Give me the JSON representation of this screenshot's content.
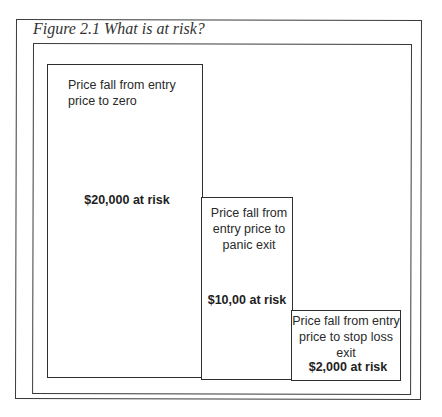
{
  "figure": {
    "caption": "Figure 2.1 What is at risk?"
  },
  "bars": [
    {
      "description": "Price fall from entry price to zero",
      "risk_label": "$20,000 at risk"
    },
    {
      "description": "Price fall from entry price to panic exit",
      "risk_label": "$10,00 at risk"
    },
    {
      "description": "Price fall from entry price to stop loss exit",
      "risk_label": "$2,000 at risk"
    }
  ],
  "chart_data": {
    "type": "bar",
    "title": "Figure 2.1 What is at risk?",
    "categories": [
      "Price fall from entry price to zero",
      "Price fall from entry price to panic exit",
      "Price fall from entry price to stop loss exit"
    ],
    "values": [
      20000,
      10000,
      2000
    ],
    "data_labels": [
      "$20,000 at risk",
      "$10,00 at risk",
      "$2,000 at risk"
    ],
    "xlabel": "",
    "ylabel": "",
    "grid": false,
    "legend": "none",
    "axes_visible": false
  }
}
